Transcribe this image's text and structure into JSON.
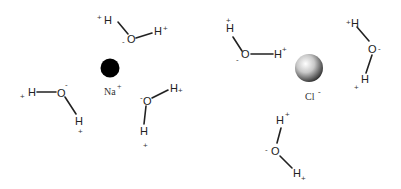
{
  "diagram": {
    "type": "ion hydration",
    "ions": [
      {
        "symbol": "Na",
        "charge": "+",
        "label": "Na",
        "color": "#000000"
      },
      {
        "symbol": "Cl",
        "charge": "-",
        "label": "Cl",
        "color": "#9a9a9a"
      }
    ],
    "water_molecules": [
      {
        "around": "Na",
        "O": "O",
        "O_charge": "-",
        "H1": "H",
        "H1_charge": "+",
        "H2": "H",
        "H2_charge": "+"
      },
      {
        "around": "Na",
        "O": "O",
        "O_charge": "-",
        "H1": "H",
        "H1_charge": "+",
        "H2": "H",
        "H2_charge": "+"
      },
      {
        "around": "Na",
        "O": "O",
        "O_charge": "-",
        "H1": "H",
        "H1_charge": "+",
        "H2": "H",
        "H2_charge": "+"
      },
      {
        "around": "Cl",
        "O": "O",
        "O_charge": "-",
        "H1": "H",
        "H1_charge": "+",
        "H2": "H",
        "H2_charge": "+"
      },
      {
        "around": "Cl",
        "O": "O",
        "O_charge": "-",
        "H1": "H",
        "H1_charge": "+",
        "H2": "H",
        "H2_charge": "+"
      },
      {
        "around": "Cl",
        "O": "O",
        "O_charge": "-",
        "H1": "H",
        "H1_charge": "+",
        "H2": "H",
        "H2_charge": "+"
      }
    ]
  }
}
